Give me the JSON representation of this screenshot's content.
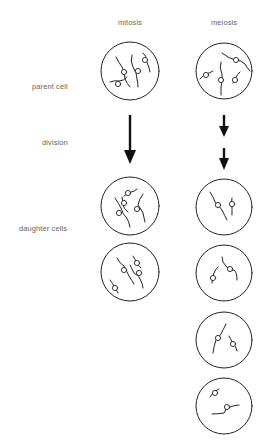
{
  "columns": {
    "mitosis": "mitosis",
    "meiosis": "meiosis"
  },
  "rows": {
    "parent": "parent cell",
    "division": "division",
    "daughters": "daughter cells"
  },
  "colors": {
    "stroke": "#222222",
    "label": "#666666",
    "background": "#ffffff"
  },
  "mitosis": {
    "parent_cells": 1,
    "division_arrows": 1,
    "daughter_cells": 2,
    "chromosomes_per_cell": 4
  },
  "meiosis": {
    "parent_cells": 1,
    "division_arrows": 2,
    "daughter_cells": 4,
    "chromosomes_per_cell": 2
  }
}
